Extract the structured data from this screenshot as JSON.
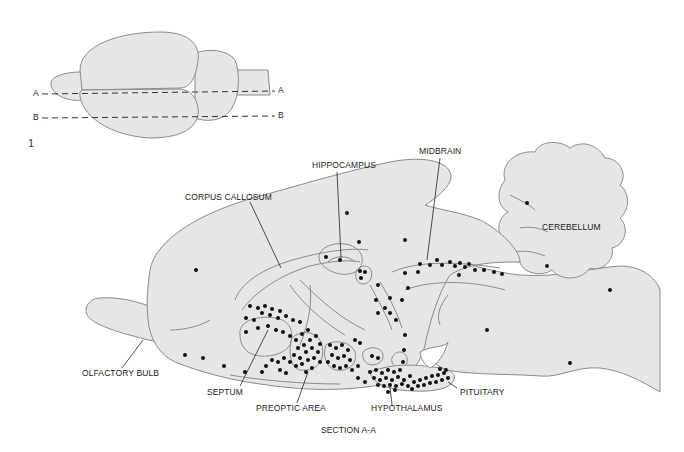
{
  "figure": {
    "number": "1",
    "section_title": "SECTION A-A",
    "colors": {
      "tissue_fill": "#e6e6e6",
      "outline": "#8a8a8a",
      "dot": "#111111",
      "leader": "#222222"
    }
  },
  "dorsal_view": {
    "cut_lines": [
      {
        "left_label": "A",
        "right_label": "A"
      },
      {
        "left_label": "B",
        "right_label": "B"
      }
    ]
  },
  "sagittal_section": {
    "labels": {
      "hippocampus": "HIPPOCAMPUS",
      "midbrain": "MIDBRAIN",
      "corpus_callosum": "CORPUS CALLOSUM",
      "cerebellum": "CEREBELLUM",
      "olfactory_bulb": "OLFACTORY BULB",
      "septum": "SEPTUM",
      "preoptic_area": "PREOPTIC AREA",
      "hypothalamus": "HYPOTHALAMUS",
      "pituitary": "PITUITARY"
    }
  }
}
